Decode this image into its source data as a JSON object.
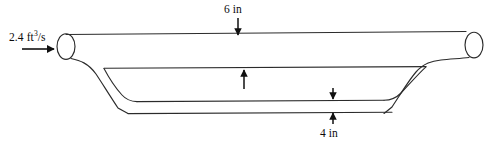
{
  "figure": {
    "type": "engineering-flow-diagram",
    "background_color": "#ffffff",
    "line_color": "#1a1a1a",
    "text_color": "#0b0b0b"
  },
  "labels": {
    "inlet_flow": {
      "value": "2.4",
      "unit_base": "ft",
      "unit_exponent": "3",
      "unit_per": "/s",
      "text": "2.4 ft3/s"
    },
    "dimension_top": {
      "text": "6 in",
      "value": "6",
      "unit": "in"
    },
    "dimension_bottom": {
      "text": "4 in",
      "value": "4",
      "unit": "in"
    }
  },
  "annotations": {
    "inlet_arrow": "flow-direction-right",
    "top_dimension_arrow_down": "arrow-down-to-pipe-top",
    "top_dimension_arrow_up": "arrow-up-from-channel-top",
    "bottom_dimension_arrow_down": "arrow-down-to-channel-bottom",
    "bottom_dimension_arrow_up": "arrow-up-to-outer-bottom"
  },
  "geometry": {
    "pipe_top_line_y": 38,
    "pipe_bottom_line_y": 56,
    "channel_top_line_y": 68,
    "channel_mid_line_y": 101,
    "channel_bottom_line_y": 113,
    "left_ellipse_cx": 66,
    "left_ellipse_cy": 47,
    "right_ellipse_cx": 474,
    "right_ellipse_cy": 45,
    "ellipse_rx": 9,
    "ellipse_ry": 13
  }
}
